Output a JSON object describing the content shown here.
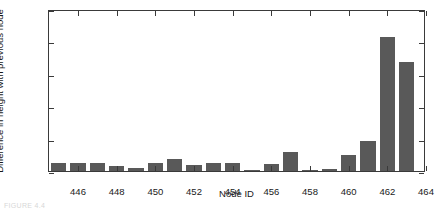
{
  "figure": {
    "caption": "FIGURE 4.4"
  },
  "chart_data": {
    "type": "bar",
    "title": "",
    "xlabel": "Node ID",
    "ylabel": "Difference in height with previous node",
    "xlim": [
      444.5,
      464.0
    ],
    "ylim": [
      0,
      0.25
    ],
    "grid": false,
    "legend": false,
    "bar_color": "#595959",
    "axis_color": "#3a3a3a",
    "xticks": [
      446,
      448,
      450,
      452,
      454,
      456,
      458,
      460,
      462,
      464
    ],
    "xticklabels": [
      "446",
      "448",
      "450",
      "452",
      "454",
      "456",
      "458",
      "460",
      "462",
      "464"
    ],
    "yticks": [
      0,
      0.05,
      0.1,
      0.15,
      0.2,
      0.25
    ],
    "yticklabels": [
      "0",
      "0.05",
      "0.1",
      "0.15",
      "0.2",
      "0.25"
    ],
    "categories": [
      445,
      446,
      447,
      448,
      449,
      450,
      451,
      452,
      453,
      454,
      455,
      456,
      457,
      458,
      459,
      460,
      461,
      462,
      463
    ],
    "values": [
      0.012,
      0.013,
      0.013,
      0.008,
      0.005,
      0.013,
      0.019,
      0.009,
      0.012,
      0.012,
      0.002,
      0.011,
      0.029,
      0.002,
      0.003,
      0.025,
      0.046,
      0.207,
      0.168
    ]
  }
}
